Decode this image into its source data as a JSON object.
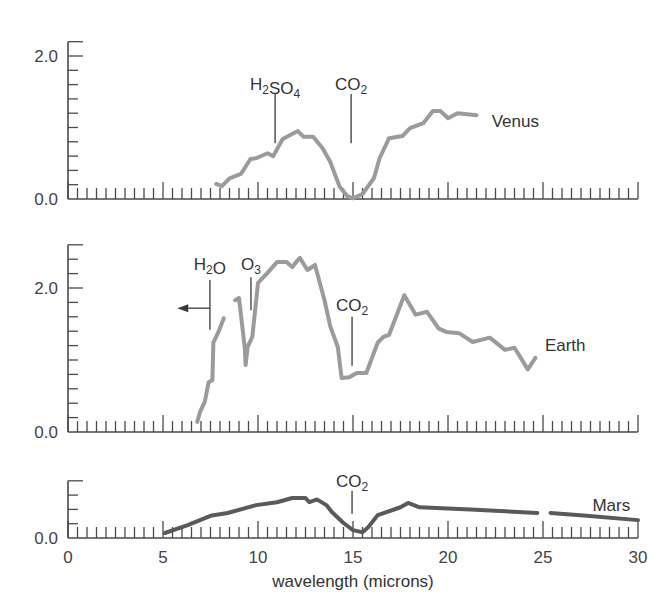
{
  "chart_data": {
    "type": "line",
    "title": "",
    "xlabel": "wavelength (microns)",
    "ylabel": "",
    "xlim": [
      0,
      30
    ],
    "x_ticks": [
      0,
      5,
      10,
      15,
      20,
      25,
      30
    ],
    "x_minor_step": 0.5,
    "grid": false,
    "legend": "none (panels labeled inline)",
    "colors": {
      "curve_light": "#9b9b9b",
      "curve_dark": "#5a5a5a",
      "axis": "#4a4a4a",
      "text": "#333333"
    },
    "panels": [
      {
        "name": "Venus",
        "label": "Venus",
        "label_pos": [
          22.3,
          1.09
        ],
        "ylim": [
          0,
          2.2
        ],
        "y_tick_step": 0.2,
        "y_tick_labels": [
          {
            "v": 0.0,
            "text": "0.0"
          },
          {
            "v": 2.0,
            "text": "2.0"
          }
        ],
        "color": "#9b9b9b",
        "segments": [
          [
            [
              7.8,
              0.21
            ],
            [
              8.1,
              0.18
            ],
            [
              8.5,
              0.29
            ],
            [
              9.1,
              0.35
            ],
            [
              9.6,
              0.56
            ],
            [
              9.9,
              0.57
            ],
            [
              10.5,
              0.64
            ],
            [
              10.8,
              0.6
            ],
            [
              11.3,
              0.84
            ],
            [
              12.1,
              0.95
            ],
            [
              12.4,
              0.87
            ],
            [
              12.9,
              0.87
            ],
            [
              13.4,
              0.71
            ],
            [
              13.8,
              0.52
            ],
            [
              14.3,
              0.17
            ],
            [
              14.7,
              0.04
            ],
            [
              15.0,
              0.01
            ],
            [
              15.5,
              0.07
            ],
            [
              16.1,
              0.29
            ],
            [
              16.4,
              0.57
            ],
            [
              16.9,
              0.85
            ],
            [
              17.6,
              0.88
            ],
            [
              18.0,
              0.99
            ],
            [
              18.7,
              1.06
            ],
            [
              19.2,
              1.23
            ],
            [
              19.6,
              1.23
            ],
            [
              20.0,
              1.13
            ],
            [
              20.5,
              1.2
            ],
            [
              21.5,
              1.17
            ]
          ]
        ],
        "annotations": [
          {
            "text": "H₂SO₄",
            "x": 10.9,
            "line": [
              0.78,
              1.47
            ],
            "text_y": 1.52
          },
          {
            "text": "CO₂",
            "x": 14.9,
            "line": [
              0.78,
              1.47
            ],
            "text_y": 1.52
          }
        ]
      },
      {
        "name": "Earth",
        "label": "Earth",
        "label_pos": [
          25.1,
          1.21
        ],
        "ylim": [
          0,
          2.6
        ],
        "y_tick_step": 0.2,
        "y_tick_labels": [
          {
            "v": 0.0,
            "text": "0.0"
          },
          {
            "v": 2.0,
            "text": "2.0"
          }
        ],
        "color": "#9b9b9b",
        "segments": [
          [
            [
              6.8,
              0.14
            ],
            [
              6.95,
              0.28
            ],
            [
              7.2,
              0.42
            ],
            [
              7.4,
              0.69
            ],
            [
              7.6,
              0.72
            ],
            [
              7.65,
              1.24
            ],
            [
              7.9,
              1.38
            ],
            [
              8.2,
              1.58
            ]
          ],
          [
            [
              8.8,
              1.83
            ],
            [
              9.0,
              1.86
            ],
            [
              9.3,
              1.18
            ],
            [
              9.35,
              0.93
            ],
            [
              9.45,
              1.18
            ],
            [
              9.7,
              1.32
            ],
            [
              10.0,
              2.07
            ],
            [
              10.5,
              2.21
            ],
            [
              11.0,
              2.36
            ],
            [
              11.5,
              2.36
            ],
            [
              11.8,
              2.29
            ],
            [
              12.2,
              2.42
            ],
            [
              12.6,
              2.25
            ],
            [
              13.0,
              2.32
            ],
            [
              13.5,
              1.83
            ],
            [
              13.8,
              1.47
            ],
            [
              14.2,
              1.18
            ],
            [
              14.4,
              0.75
            ],
            [
              14.8,
              0.76
            ],
            [
              15.2,
              0.82
            ],
            [
              15.7,
              0.82
            ],
            [
              16.3,
              1.24
            ],
            [
              16.6,
              1.32
            ],
            [
              16.9,
              1.35
            ],
            [
              17.7,
              1.9
            ],
            [
              18.3,
              1.63
            ],
            [
              18.9,
              1.67
            ],
            [
              19.5,
              1.44
            ],
            [
              19.9,
              1.39
            ],
            [
              20.6,
              1.37
            ],
            [
              21.3,
              1.25
            ],
            [
              22.2,
              1.31
            ],
            [
              23.0,
              1.14
            ],
            [
              23.5,
              1.17
            ],
            [
              24.2,
              0.87
            ],
            [
              24.6,
              1.03
            ]
          ]
        ],
        "annotations": [
          {
            "text": "H₂O",
            "x": 7.47,
            "line": [
              1.42,
              2.11
            ],
            "text_y": 2.25,
            "arrow": {
              "y": 1.72,
              "to_x": 5.75
            }
          },
          {
            "text": "O₃",
            "x": 9.63,
            "line": [
              1.69,
              2.15
            ],
            "text_y": 2.25
          },
          {
            "text": "CO₂",
            "x": 14.95,
            "line": [
              0.92,
              1.6
            ],
            "text_y": 1.68
          }
        ]
      },
      {
        "name": "Mars",
        "label": "Mars",
        "label_pos": [
          27.6,
          0.46
        ],
        "ylim": [
          0,
          0.8
        ],
        "y_tick_step": 0.2,
        "y_tick_labels": [
          {
            "v": 0.0,
            "text": "0.0"
          }
        ],
        "color": "#5a5a5a",
        "segments": [
          [
            [
              5.1,
              0.07
            ],
            [
              6.3,
              0.18
            ],
            [
              7.5,
              0.31
            ],
            [
              8.4,
              0.35
            ],
            [
              9.9,
              0.46
            ],
            [
              11.0,
              0.5
            ],
            [
              11.8,
              0.56
            ],
            [
              12.5,
              0.56
            ],
            [
              12.7,
              0.5
            ],
            [
              13.1,
              0.54
            ],
            [
              13.6,
              0.46
            ],
            [
              13.9,
              0.36
            ],
            [
              14.5,
              0.21
            ],
            [
              15.0,
              0.11
            ],
            [
              15.5,
              0.08
            ],
            [
              15.8,
              0.15
            ],
            [
              16.3,
              0.32
            ],
            [
              17.5,
              0.43
            ],
            [
              17.9,
              0.49
            ],
            [
              18.5,
              0.43
            ],
            [
              21.2,
              0.4
            ],
            [
              24.7,
              0.35
            ]
          ],
          [
            [
              25.4,
              0.35
            ],
            [
              27.3,
              0.31
            ],
            [
              30.0,
              0.25
            ]
          ]
        ],
        "annotations": [
          {
            "text": "CO₂",
            "x": 14.95,
            "line": [
              0.34,
              0.66
            ],
            "text_y": 0.71
          }
        ]
      }
    ]
  },
  "layout_px": {
    "x0": 68,
    "px_per_micron": 19,
    "panels": [
      {
        "baseline": 199,
        "px_per_unit": 71.5
      },
      {
        "baseline": 432,
        "px_per_unit": 72
      },
      {
        "baseline": 538,
        "px_per_unit": 71.5
      }
    ],
    "x_tick_label_y": 563,
    "x_title_y": 587
  }
}
